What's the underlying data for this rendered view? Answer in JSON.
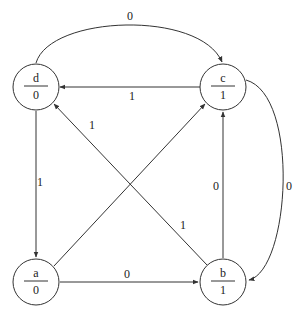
{
  "diagram": {
    "type": "moore-state-machine",
    "nodes": [
      {
        "id": "d",
        "name": "d",
        "output": "0",
        "cx": 36,
        "cy": 87
      },
      {
        "id": "c",
        "name": "c",
        "output": "1",
        "cx": 223,
        "cy": 87
      },
      {
        "id": "a",
        "name": "a",
        "output": "0",
        "cx": 36,
        "cy": 282
      },
      {
        "id": "b",
        "name": "b",
        "output": "1",
        "cx": 223,
        "cy": 282
      }
    ],
    "edges": [
      {
        "from": "d",
        "to": "c",
        "label": "0",
        "shape": "top-arc"
      },
      {
        "from": "c",
        "to": "d",
        "label": "1",
        "shape": "straight"
      },
      {
        "from": "d",
        "to": "a",
        "label": "1",
        "shape": "straight"
      },
      {
        "from": "a",
        "to": "c",
        "label": "",
        "shape": "diagonal"
      },
      {
        "from": "b",
        "to": "d",
        "label": "1",
        "shape": "diagonal"
      },
      {
        "from": "a",
        "to": "b",
        "label": "0",
        "shape": "straight"
      },
      {
        "from": "b",
        "to": "c",
        "label": "0",
        "shape": "straight"
      },
      {
        "from": "c",
        "to": "b",
        "label": "0",
        "shape": "right-arc"
      }
    ],
    "labels": {
      "edge_d_c": "0",
      "edge_c_d": "1",
      "edge_d_a": "1",
      "edge_b_d_upper": "1",
      "edge_b_d_lower": "1",
      "edge_a_b": "0",
      "edge_b_c": "0",
      "edge_c_b": "0"
    },
    "colors": {
      "stroke": "#333333",
      "background": "#ffffff",
      "text": "#222222"
    }
  }
}
